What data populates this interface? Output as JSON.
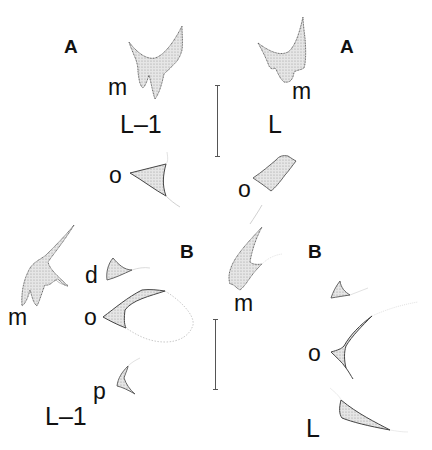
{
  "figure": {
    "panels": [
      {
        "id": "A",
        "letter_left": "A",
        "letter_right": "A",
        "left_stage": "L–1",
        "right_stage": "L",
        "left_parts": {
          "m": "m",
          "o": "o"
        },
        "right_parts": {
          "m": "m",
          "o": "o"
        }
      },
      {
        "id": "B",
        "letter_left": "B",
        "letter_right": "B",
        "left_stage": "L–1",
        "right_stage": "L",
        "left_parts": {
          "m": "m",
          "d": "d",
          "o": "o",
          "p": "p"
        },
        "right_parts": {
          "m": "m",
          "o": "o"
        }
      }
    ],
    "colors": {
      "ink": "#111111",
      "stipple_fill": "#d6d6d6",
      "outline": "#444444",
      "faint_outline": "#bbbbbb",
      "scale_bar": "#555555"
    }
  }
}
